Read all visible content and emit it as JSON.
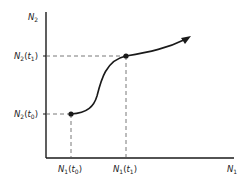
{
  "diagram": {
    "type": "phase-trajectory",
    "axes": {
      "x": {
        "label": "N",
        "subscript": "1"
      },
      "y": {
        "label": "N",
        "subscript": "2"
      }
    },
    "y_ticks": [
      {
        "label": "N",
        "subscript": "2",
        "arg": "t",
        "arg_sub": "1"
      },
      {
        "label": "N",
        "subscript": "2",
        "arg": "t",
        "arg_sub": "0"
      }
    ],
    "x_ticks": [
      {
        "label": "N",
        "subscript": "1",
        "arg": "t",
        "arg_sub": "0"
      },
      {
        "label": "N",
        "subscript": "1",
        "arg": "t",
        "arg_sub": "1"
      }
    ],
    "points": [
      {
        "name": "t0",
        "px": [
          71,
          114
        ]
      },
      {
        "name": "t1",
        "px": [
          126,
          56
        ]
      }
    ],
    "colors": {
      "line": "#1a1a1a",
      "dash": "#555555",
      "text": "#222222"
    }
  }
}
